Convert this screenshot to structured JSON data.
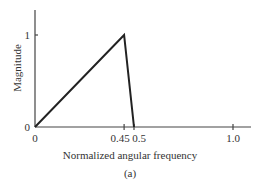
{
  "chart_data": {
    "type": "line",
    "title": "",
    "caption": "(a)",
    "xlabel": "Normalized angular frequency",
    "ylabel": "Magnitude",
    "xlim": [
      0,
      1.1
    ],
    "ylim": [
      0,
      1.3
    ],
    "grid": false,
    "legend": null,
    "x_ticks": [
      {
        "value": 0,
        "label": "0"
      },
      {
        "value": 0.45,
        "label": "0.45"
      },
      {
        "value": 0.5,
        "label": "0.5"
      },
      {
        "value": 1.0,
        "label": "1.0"
      }
    ],
    "y_ticks": [
      {
        "value": 0,
        "label": "0"
      },
      {
        "value": 1,
        "label": "1"
      }
    ],
    "series": [
      {
        "name": "magnitude response",
        "x": [
          0,
          0.45,
          0.5,
          1.0
        ],
        "y": [
          0,
          1,
          0,
          0
        ],
        "color": "#222222"
      }
    ]
  },
  "colors": {
    "axis": "#444444",
    "line": "#222222",
    "text": "#333333",
    "background": "#ffffff"
  }
}
